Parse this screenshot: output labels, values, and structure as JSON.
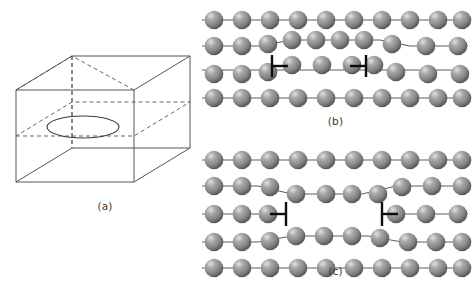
{
  "figure": {
    "background_color": "#ffffff",
    "atom_color": "#8c8c8c",
    "atom_highlight_color": "#d8d8d8",
    "atom_shadow_color": "#4f4f4f",
    "bond_color": "#4a4a4a",
    "dislocation_symbol_color": "#0d0d0d",
    "cube_line_color": "#555555"
  },
  "panels": [
    {
      "id": "a",
      "caption": "(a)",
      "description": "Three-dimensional cube containing a dislocation loop lying on an internal horizontal slip plane",
      "cube": {
        "front_face": {
          "x": 16,
          "y": 42,
          "width": 118,
          "height": 92
        },
        "depth_offset": {
          "dx": 56,
          "dy": -34
        },
        "solid_edges": 9,
        "hidden_edges_dashed": 3,
        "slip_plane_dashed": true
      },
      "loop": {
        "shape": "ellipse",
        "center_x": 83,
        "center_y": 79,
        "radius_x": 36,
        "radius_y": 11,
        "stroke_style": "solid"
      }
    },
    {
      "id": "b",
      "caption": "(b)",
      "description": "Edge dislocation pair with narrow separation; extra half-plane region between the two dislocation markers",
      "row_count": 4,
      "atoms_per_row": 10,
      "dislocation_markers": [
        {
          "type": "left-dislocation",
          "symbol": "right-tack",
          "x": 76,
          "y": 63
        },
        {
          "type": "right-dislocation",
          "symbol": "left-tack",
          "x": 166,
          "y": 63
        }
      ],
      "separation_px": 90,
      "separation_label": "narrow"
    },
    {
      "id": "c",
      "caption": "(c)",
      "description": "Edge dislocation pair with wide separation; the middle row is split by a broad gap between the markers",
      "row_count": 5,
      "atoms_per_row": 10,
      "dislocation_markers": [
        {
          "type": "left-dislocation",
          "symbol": "left-tack",
          "x": 58,
          "y": 66
        },
        {
          "type": "right-dislocation",
          "symbol": "right-tack",
          "x": 188,
          "y": 66
        }
      ],
      "separation_px": 130,
      "separation_label": "wide"
    }
  ]
}
